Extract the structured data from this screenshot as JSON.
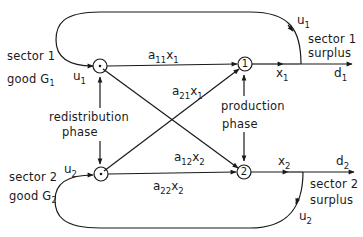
{
  "diagram": {
    "type": "flow-graph",
    "sectors": [
      {
        "label": "sector 1",
        "good_prefix": "good G",
        "good_index": "1",
        "surplus_line1": "sector 1",
        "surplus_line2": "surplus"
      },
      {
        "label": "sector 2",
        "good_prefix": "good G",
        "good_index": "2",
        "surplus_line1": "sector 2",
        "surplus_line2": "surplus"
      }
    ],
    "nodes": {
      "redistribution_1": {
        "label": ""
      },
      "redistribution_2": {
        "label": ""
      },
      "production_1": {
        "label": "1"
      },
      "production_2": {
        "label": "2"
      }
    },
    "phases": {
      "redistribution": {
        "line1": "redistribution",
        "line2": "phase"
      },
      "production": {
        "line1": "production",
        "line2": "phase"
      }
    },
    "edges": {
      "a11x1": {
        "a": "a",
        "a_idx": "11",
        "x": "x",
        "x_idx": "1"
      },
      "a21x1": {
        "a": "a",
        "a_idx": "21",
        "x": "x",
        "x_idx": "1"
      },
      "a12x2": {
        "a": "a",
        "a_idx": "12",
        "x": "x",
        "x_idx": "2"
      },
      "a22x2": {
        "a": "a",
        "a_idx": "22",
        "x": "x",
        "x_idx": "2"
      },
      "x1": {
        "sym": "x",
        "idx": "1"
      },
      "x2": {
        "sym": "x",
        "idx": "2"
      },
      "d1": {
        "sym": "d",
        "idx": "1"
      },
      "d2": {
        "sym": "d",
        "idx": "2"
      },
      "u1_in": {
        "sym": "u",
        "idx": "1"
      },
      "u1_loop": {
        "sym": "u",
        "idx": "1"
      },
      "u2_in": {
        "sym": "u",
        "idx": "2"
      },
      "u2_loop": {
        "sym": "u",
        "idx": "2"
      }
    },
    "colors": {
      "stroke": "#1a1a1a",
      "background": "#ffffff"
    }
  }
}
